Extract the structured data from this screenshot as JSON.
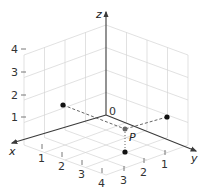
{
  "axes": {
    "x_label": "x",
    "y_label": "y",
    "z_label": "z",
    "origin_label": "0"
  },
  "ticks": {
    "x": [
      "1",
      "2",
      "3",
      "4"
    ],
    "y": [
      "1",
      "2",
      "3"
    ],
    "z": [
      "1",
      "2",
      "3",
      "4"
    ]
  },
  "points": {
    "p_label": "P",
    "P": {
      "x": 3,
      "y": 2,
      "z": 1
    },
    "projections": [
      {
        "name": "xz-plane projection",
        "x": 3,
        "y": 0,
        "z": 1
      },
      {
        "name": "yz-plane projection",
        "x": 0,
        "y": 2,
        "z": 1
      },
      {
        "name": "xy-plane projection",
        "x": 3,
        "y": 2,
        "z": 0
      }
    ]
  },
  "colors": {
    "axis": "#3a3a3a",
    "grid": "#d4d4d4",
    "point": "#111111"
  }
}
